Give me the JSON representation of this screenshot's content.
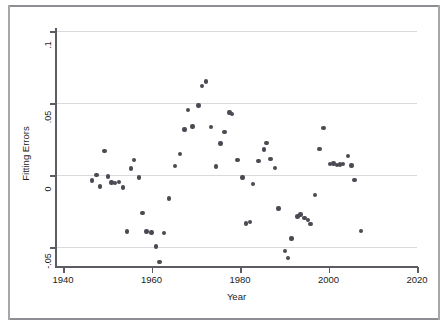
{
  "figure": {
    "background_color": "#ffffff",
    "border_color": "#8d8d93",
    "marker_color": "#4a4a52",
    "axis_color": "#5c5c63",
    "grid_color": "#d9d9de"
  },
  "chart_data": {
    "type": "scatter",
    "title": "",
    "xlabel": "Year",
    "ylabel": "Fitting Errors",
    "xlim": [
      1940,
      2020
    ],
    "ylim": [
      -0.065,
      0.1
    ],
    "xticks": [
      1940,
      1960,
      1980,
      2000,
      2020
    ],
    "xtick_labels": [
      "1940",
      "1960",
      "1980",
      "2000",
      "2020"
    ],
    "yticks": [
      0.1,
      0.05,
      0,
      -0.05
    ],
    "ytick_labels": [
      ".1",
      ".05",
      "0",
      "-.05"
    ],
    "grid": "horizontal",
    "legend": null,
    "series": [
      {
        "name": "Fitting Errors",
        "marker": "circle",
        "color": "#4a4a52",
        "points": [
          [
            1946.6,
            -0.0039
          ],
          [
            1947.6,
            0.0
          ],
          [
            1948.3,
            -0.0081
          ],
          [
            1949.4,
            0.0167
          ],
          [
            1950.2,
            -0.001
          ],
          [
            1951.0,
            -0.0051
          ],
          [
            1951.8,
            -0.0055
          ],
          [
            1952.6,
            -0.0047
          ],
          [
            1953.5,
            -0.0086
          ],
          [
            1954.4,
            -0.0392
          ],
          [
            1955.3,
            0.0045
          ],
          [
            1956.1,
            0.0104
          ],
          [
            1957.2,
            -0.0017
          ],
          [
            1958.0,
            -0.0264
          ],
          [
            1958.9,
            -0.0392
          ],
          [
            1960.0,
            -0.04
          ],
          [
            1961.0,
            -0.0497
          ],
          [
            1961.8,
            -0.0606
          ],
          [
            1962.8,
            -0.0404
          ],
          [
            1964.0,
            -0.0162
          ],
          [
            1965.3,
            0.0061
          ],
          [
            1966.4,
            0.0145
          ],
          [
            1967.5,
            0.0317
          ],
          [
            1968.2,
            0.0452
          ],
          [
            1969.3,
            0.0337
          ],
          [
            1970.6,
            0.0483
          ],
          [
            1971.4,
            0.0616
          ],
          [
            1972.3,
            0.0648
          ],
          [
            1973.5,
            0.0334
          ],
          [
            1974.6,
            0.0058
          ],
          [
            1975.6,
            0.022
          ],
          [
            1976.5,
            0.03
          ],
          [
            1977.6,
            0.0435
          ],
          [
            1978.2,
            0.0423
          ],
          [
            1979.4,
            0.0105
          ],
          [
            1980.6,
            -0.0017
          ],
          [
            1981.4,
            -0.0337
          ],
          [
            1982.2,
            -0.0327
          ],
          [
            1982.9,
            -0.0061
          ],
          [
            1984.2,
            0.0099
          ],
          [
            1985.4,
            0.0178
          ],
          [
            1986.0,
            0.0222
          ],
          [
            1986.9,
            0.0113
          ],
          [
            1987.9,
            0.0047
          ],
          [
            1988.7,
            -0.0232
          ],
          [
            1990.2,
            -0.0528
          ],
          [
            1990.9,
            -0.0575
          ],
          [
            1991.6,
            -0.044
          ],
          [
            1993.0,
            -0.0288
          ],
          [
            1993.7,
            -0.0274
          ],
          [
            1994.6,
            -0.03
          ],
          [
            1995.3,
            -0.0311
          ],
          [
            1995.9,
            -0.0341
          ],
          [
            1997.0,
            -0.0141
          ],
          [
            1998.0,
            0.018
          ],
          [
            1998.9,
            0.0325
          ],
          [
            2000.3,
            0.0078
          ],
          [
            2001.1,
            0.008
          ],
          [
            2001.9,
            0.0071
          ],
          [
            2002.6,
            0.0073
          ],
          [
            2003.3,
            0.0075
          ],
          [
            2004.4,
            0.0132
          ],
          [
            2005.2,
            0.0066
          ],
          [
            2005.9,
            -0.0035
          ],
          [
            2007.4,
            -0.039
          ]
        ]
      }
    ]
  }
}
